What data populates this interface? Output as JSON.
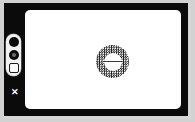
{
  "window": {
    "title": "Canvas",
    "chassis_color": "#0b0b0b",
    "canvas_color": "#ffffff",
    "page_background": "#d2d2d2"
  },
  "toolbar": {
    "name": "tool-pill",
    "orientation": "vertical",
    "items": [
      {
        "id": "tool-0",
        "icon": "filled-circle-icon",
        "label": "",
        "state": "selected"
      },
      {
        "id": "tool-1",
        "icon": "ring-circle-icon",
        "label": "",
        "state": "normal"
      },
      {
        "id": "tool-2",
        "icon": "outlined-square-icon",
        "label": "",
        "state": "normal"
      }
    ]
  },
  "close_button": {
    "icon": "close-x-icon",
    "label": "✕"
  },
  "canvas": {
    "shapes": [
      {
        "id": "halftone-donut",
        "type": "annulus",
        "fill": "halftone-checker",
        "fill_color": "#1a1a1a",
        "hole_color": "#ffffff",
        "center_line": true,
        "center_line_color": "#3a3a3a"
      }
    ]
  }
}
